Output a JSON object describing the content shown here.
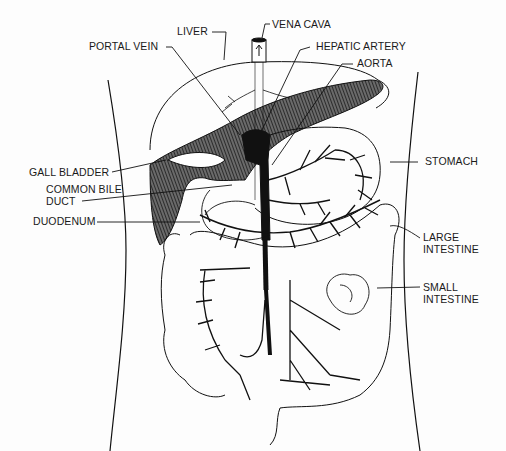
{
  "diagram": {
    "colors": {
      "ink": "#111111",
      "paper": "#fdfdfd",
      "shade": "#3a3a3a"
    },
    "labels": [
      {
        "id": "liver",
        "text": "LIVER"
      },
      {
        "id": "vena_cava",
        "text": "VENA CAVA"
      },
      {
        "id": "portal_vein",
        "text": "PORTAL VEIN"
      },
      {
        "id": "hepatic_artery",
        "text": "HEPATIC ARTERY"
      },
      {
        "id": "aorta",
        "text": "AORTA"
      },
      {
        "id": "gall_bladder",
        "text": "GALL BLADDER"
      },
      {
        "id": "stomach",
        "text": "STOMACH"
      },
      {
        "id": "common_bile_duct_1",
        "text": "COMMON BILE"
      },
      {
        "id": "common_bile_duct_2",
        "text": "DUCT"
      },
      {
        "id": "duodenum",
        "text": "DUODENUM"
      },
      {
        "id": "large_intestine_1",
        "text": "LARGE"
      },
      {
        "id": "large_intestine_2",
        "text": "INTESTINE"
      },
      {
        "id": "small_intestine_1",
        "text": "SMALL"
      },
      {
        "id": "small_intestine_2",
        "text": "INTESTINE"
      }
    ]
  }
}
